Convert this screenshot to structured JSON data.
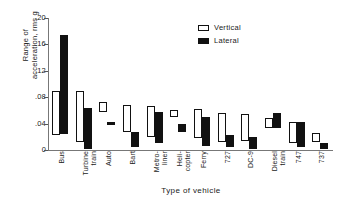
{
  "chart_data": {
    "type": "bar",
    "subtype": "floating-range-bar",
    "title": "",
    "xlabel": "Type of vehicle",
    "ylabel": "Range of acceleration, rms g",
    "ylabel_line1": "Range of",
    "ylabel_line2": "acceleration, rms g",
    "ylim": [
      0,
      0.2
    ],
    "yticks": [
      0,
      0.04,
      0.08,
      0.12,
      0.16,
      0.2
    ],
    "ytick_labels": [
      "0",
      ".04",
      ".08",
      ".12",
      ".16",
      ".20"
    ],
    "grid": false,
    "legend_position": "top-right",
    "categories": [
      "Bus",
      "Turbine train",
      "Auto",
      "Bart",
      "Metroliner",
      "Helicopter",
      "Ferry",
      "727",
      "DC-9",
      "Diesel train",
      "747",
      "737"
    ],
    "category_labels": [
      [
        "Bus"
      ],
      [
        "Turbine",
        "train"
      ],
      [
        "Auto"
      ],
      [
        "Bart"
      ],
      [
        "Metro-",
        "liner"
      ],
      [
        "Heli-",
        "copter"
      ],
      [
        "Ferry"
      ],
      [
        "727"
      ],
      [
        "DC-9"
      ],
      [
        "Diesel",
        "train"
      ],
      [
        "747"
      ],
      [
        "737"
      ]
    ],
    "series": [
      {
        "name": "Vertical",
        "style": "open",
        "color": "#ffffff",
        "edge_color": "#111111",
        "ranges": [
          [
            0.022,
            0.09
          ],
          [
            0.012,
            0.09
          ],
          [
            0.058,
            0.072
          ],
          [
            0.028,
            0.068
          ],
          [
            0.02,
            0.066
          ],
          [
            0.05,
            0.06
          ],
          [
            0.018,
            0.062
          ],
          [
            0.012,
            0.056
          ],
          [
            0.014,
            0.054
          ],
          [
            0.034,
            0.048
          ],
          [
            0.01,
            0.042
          ],
          [
            0.012,
            0.026
          ]
        ]
      },
      {
        "name": "Lateral",
        "style": "filled",
        "color": "#111111",
        "edge_color": "#111111",
        "ranges": [
          [
            0.024,
            0.174
          ],
          [
            0.002,
            0.064
          ],
          [
            0.038,
            0.042
          ],
          [
            0.004,
            0.028
          ],
          [
            0.01,
            0.058
          ],
          [
            0.028,
            0.04
          ],
          [
            0.006,
            0.05
          ],
          [
            0.004,
            0.022
          ],
          [
            0.002,
            0.02
          ],
          [
            0.034,
            0.056
          ],
          [
            0.004,
            0.042
          ],
          [
            0.002,
            0.01
          ]
        ]
      }
    ]
  },
  "legend": {
    "items": [
      {
        "label": "Vertical",
        "style": "vertical"
      },
      {
        "label": "Lateral",
        "style": "lateral"
      }
    ]
  }
}
